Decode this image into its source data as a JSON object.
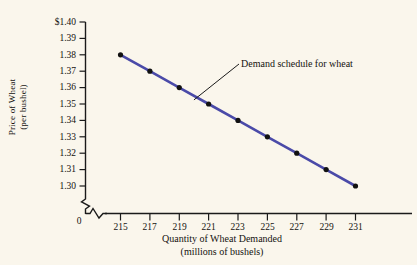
{
  "chart_data": {
    "type": "line",
    "title": "",
    "subtitle": "",
    "xlabel_line1": "Quantity of Wheat Demanded",
    "xlabel_line2": "(millions of bushels)",
    "ylabel_line1": "Price of Wheat",
    "ylabel_line2": "(per bushel)",
    "x": [
      215,
      217,
      219,
      221,
      223,
      225,
      227,
      229,
      231
    ],
    "values": [
      1.38,
      1.37,
      1.36,
      1.35,
      1.34,
      1.33,
      1.32,
      1.31,
      1.3
    ],
    "series": [
      {
        "name": "Demand schedule for wheat",
        "values": [
          1.38,
          1.37,
          1.36,
          1.35,
          1.34,
          1.33,
          1.32,
          1.31,
          1.3
        ]
      }
    ],
    "xtick_labels": [
      "215",
      "217",
      "219",
      "221",
      "223",
      "225",
      "227",
      "229",
      "231"
    ],
    "ytick_labels": [
      "$1.40",
      "1.39",
      "1.38",
      "1.37",
      "1.36",
      "1.35",
      "1.34",
      "1.33",
      "1.32",
      "1.31",
      "1.30"
    ],
    "ytick_values": [
      1.4,
      1.39,
      1.38,
      1.37,
      1.36,
      1.35,
      1.34,
      1.33,
      1.32,
      1.31,
      1.3
    ],
    "xlim": [
      213.5,
      232
    ],
    "ylim": [
      1.295,
      1.405
    ],
    "origin_label": "0",
    "axis_break_x": true,
    "axis_break_y": true,
    "grid": false,
    "legend_position": "none",
    "annotations": [
      {
        "text": "Demand schedule for wheat",
        "points_to_x": 220,
        "points_to_y": 1.3525
      }
    ],
    "line_color": "#4a4aa8",
    "marker_color": "#111111",
    "axis_color": "#1a1a1a",
    "background_color": "#faf6ec"
  }
}
